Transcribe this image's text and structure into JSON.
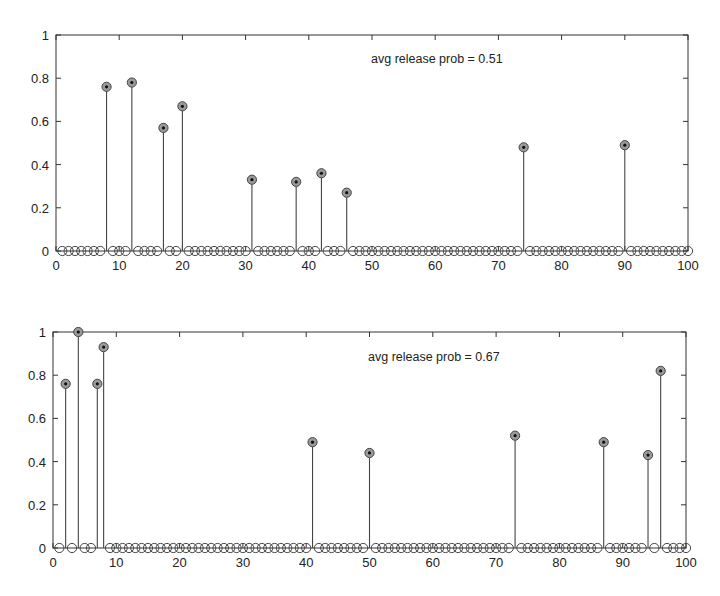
{
  "chart_data": [
    {
      "type": "stem",
      "title": "",
      "annotation": "avg release prob = 0.51",
      "xlabel": "",
      "ylabel": "",
      "xlim": [
        0,
        100
      ],
      "ylim": [
        0,
        1
      ],
      "xticks": [
        0,
        10,
        20,
        30,
        40,
        50,
        60,
        70,
        80,
        90,
        100
      ],
      "yticks": [
        0,
        0.2,
        0.4,
        0.6,
        0.8,
        1
      ],
      "ytick_labels": [
        "0",
        "0.2",
        "0.4",
        "0.6",
        "0.8",
        "1"
      ],
      "grid": false,
      "n_points": 100,
      "x": "1..100 (integers)",
      "nonzero_points": [
        {
          "x": 8,
          "y": 0.76
        },
        {
          "x": 12,
          "y": 0.78
        },
        {
          "x": 17,
          "y": 0.57
        },
        {
          "x": 20,
          "y": 0.67
        },
        {
          "x": 31,
          "y": 0.33
        },
        {
          "x": 38,
          "y": 0.32
        },
        {
          "x": 42,
          "y": 0.36
        },
        {
          "x": 46,
          "y": 0.27
        },
        {
          "x": 74,
          "y": 0.48
        },
        {
          "x": 90,
          "y": 0.49
        }
      ],
      "zero_value": 0,
      "markers": "open circles at every x; filled circle with asterisk at nonzero values"
    },
    {
      "type": "stem",
      "title": "",
      "annotation": "avg release prob = 0.67",
      "xlabel": "",
      "ylabel": "",
      "xlim": [
        0,
        100
      ],
      "ylim": [
        0,
        1
      ],
      "xticks": [
        0,
        10,
        20,
        30,
        40,
        50,
        60,
        70,
        80,
        90,
        100
      ],
      "yticks": [
        0,
        0.2,
        0.4,
        0.6,
        0.8,
        1
      ],
      "ytick_labels": [
        "0",
        "0.2",
        "0.4",
        "0.6",
        "0.8",
        "1"
      ],
      "grid": false,
      "n_points": 100,
      "x": "1..100 (integers)",
      "nonzero_points": [
        {
          "x": 2,
          "y": 0.76
        },
        {
          "x": 4,
          "y": 1.0
        },
        {
          "x": 7,
          "y": 0.76
        },
        {
          "x": 8,
          "y": 0.93
        },
        {
          "x": 41,
          "y": 0.49
        },
        {
          "x": 50,
          "y": 0.44
        },
        {
          "x": 73,
          "y": 0.52
        },
        {
          "x": 87,
          "y": 0.49
        },
        {
          "x": 94,
          "y": 0.43
        },
        {
          "x": 96,
          "y": 0.82
        }
      ],
      "zero_value": 0,
      "markers": "open circles at every x; filled circle with asterisk at nonzero values"
    }
  ],
  "style": {
    "axis_color": "#333333",
    "stem_color": "#444444",
    "marker_edge": "#444444",
    "marker_fill_active": "#9a9a9a",
    "marker_center": "#111111",
    "background": "#ffffff"
  },
  "layout": {
    "panels": [
      {
        "left": 56,
        "right": 688,
        "top": 35,
        "bottom": 251,
        "annot_x": 371,
        "annot_y": 63
      },
      {
        "left": 53,
        "right": 686,
        "top": 332,
        "bottom": 548,
        "annot_x": 368,
        "annot_y": 361
      }
    ]
  }
}
